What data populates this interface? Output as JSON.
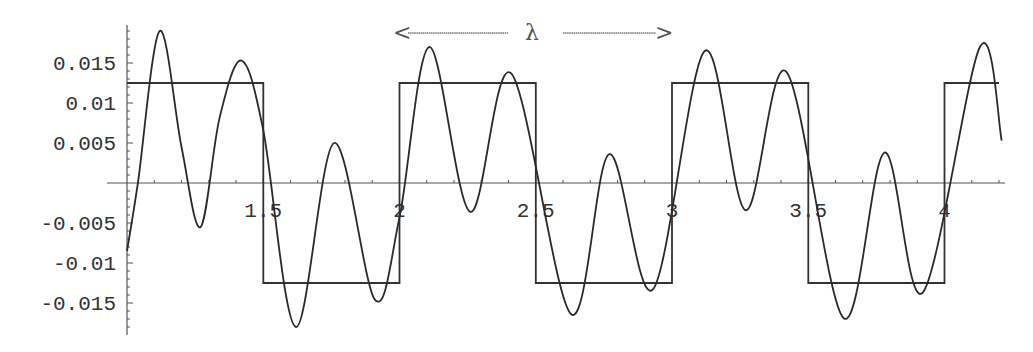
{
  "chart_data": {
    "type": "line",
    "title": "",
    "xlabel": "",
    "ylabel": "",
    "xlim": [
      1.0,
      4.23
    ],
    "ylim": [
      -0.019,
      0.02
    ],
    "grid": false,
    "legend": null,
    "x_ticks": [
      1.5,
      2,
      2.5,
      3,
      3.5,
      4
    ],
    "x_tick_labels": [
      "1.5",
      "2",
      "2.5",
      "3",
      "3.5",
      "4"
    ],
    "y_ticks": [
      0.015,
      0.01,
      0.005,
      -0.005,
      -0.01,
      -0.015
    ],
    "y_tick_labels": [
      "0.015",
      "0.01",
      "0.005",
      "-0.005",
      "-0.01",
      "-0.015"
    ],
    "annotation": {
      "text": "λ",
      "arrow_left": "<",
      "arrow_right": ">",
      "x_from": 2.0,
      "x_to": 3.0,
      "description": "wavelength arrow spanning one period"
    },
    "series": [
      {
        "name": "square wave",
        "style": "step",
        "x": [
          1.0,
          1.5,
          1.5,
          2.0,
          2.0,
          2.5,
          2.5,
          3.0,
          3.0,
          3.5,
          3.5,
          4.0,
          4.0,
          4.2
        ],
        "y": [
          0.0125,
          0.0125,
          -0.0125,
          -0.0125,
          0.0125,
          0.0125,
          -0.0125,
          -0.0125,
          0.0125,
          0.0125,
          -0.0125,
          -0.0125,
          0.0125,
          0.0125
        ]
      },
      {
        "name": "oscillating wave",
        "style": "smooth",
        "x": [
          1.0,
          1.04,
          1.12,
          1.2,
          1.27,
          1.34,
          1.42,
          1.5,
          1.62,
          1.76,
          1.91,
          2.0,
          2.11,
          2.26,
          2.41,
          2.63,
          2.77,
          2.93,
          3.12,
          3.27,
          3.42,
          3.63,
          3.78,
          3.92,
          4.13,
          4.21
        ],
        "y": [
          -0.0085,
          0.0,
          0.019,
          0.0045,
          -0.0055,
          0.0082,
          0.0153,
          0.0066,
          -0.018,
          0.005,
          -0.0146,
          -0.0043,
          0.017,
          -0.0036,
          0.0137,
          -0.0164,
          0.0036,
          -0.0133,
          0.0165,
          -0.0034,
          0.0139,
          -0.0169,
          0.0038,
          -0.0137,
          0.017,
          0.0053
        ]
      }
    ]
  },
  "render": {
    "origin_px": [
      127,
      183
    ],
    "x_px_per_unit": 272.5,
    "y_px_per_unit": 8000,
    "axis_x_end_px": 1005,
    "axis_y_top_px": 25,
    "axis_y_bottom_px": 335,
    "line_color": "#2a2a2a",
    "axis_color": "#555555"
  }
}
